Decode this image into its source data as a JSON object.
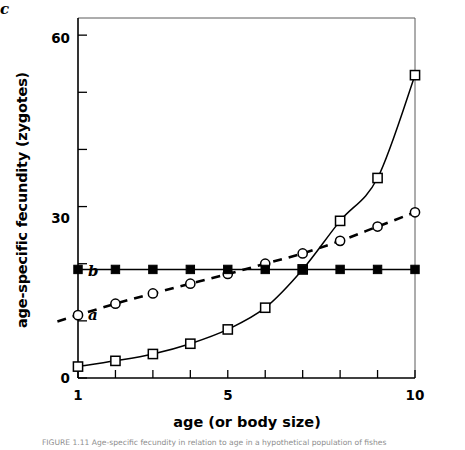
{
  "chart_data": {
    "type": "line",
    "title": "",
    "xlabel": "age (or body size)",
    "ylabel": "age-specific fecundity (zygotes)",
    "xlim": [
      1,
      10
    ],
    "ylim": [
      0,
      63
    ],
    "xticks": [
      1,
      2,
      3,
      4,
      5,
      6,
      7,
      8,
      9,
      10
    ],
    "xtick_labels": [
      "1",
      "",
      "",
      "",
      "5",
      "",
      "",
      "",
      "",
      "10"
    ],
    "yticks": [
      0,
      10,
      20,
      30,
      40,
      50,
      60
    ],
    "ytick_labels": [
      "0",
      "",
      "",
      "30",
      "",
      "",
      "60"
    ],
    "grid": false,
    "legend_position": "inline-annotations",
    "x": [
      1,
      2,
      3,
      4,
      5,
      6,
      7,
      8,
      9,
      10
    ],
    "series": [
      {
        "name": "a",
        "label": "a",
        "marker": "open-circle",
        "linestyle": "dashed",
        "color": "#000000",
        "values": [
          11.0,
          13.0,
          14.8,
          16.5,
          18.2,
          20.0,
          21.8,
          24.0,
          26.5,
          29.0
        ],
        "annotation": {
          "text": "a",
          "x": 1.45,
          "y": 13.5
        }
      },
      {
        "name": "b",
        "label": "b",
        "marker": "filled-square",
        "linestyle": "solid",
        "color": "#000000",
        "values": [
          19.0,
          19.0,
          19.0,
          19.0,
          19.0,
          19.0,
          19.0,
          19.0,
          19.0,
          19.0
        ],
        "annotation": {
          "text": "b",
          "x": 1.45,
          "y": 22.5
        }
      },
      {
        "name": "c",
        "label": "c",
        "marker": "open-square",
        "linestyle": "solid",
        "color": "#000000",
        "values": [
          2.0,
          3.0,
          4.2,
          6.0,
          8.5,
          12.3,
          19.0,
          27.5,
          35.0,
          53.0
        ],
        "annotation": {
          "text": "c",
          "x": 1.45,
          "y": 6.8
        }
      }
    ]
  },
  "caption": {
    "text": "FIGURE 1.11   Age-specific fecundity in relation to age in a hypothetical population of fishes"
  },
  "axes": {
    "frame_color": "#000000",
    "tick_color": "#000000"
  }
}
